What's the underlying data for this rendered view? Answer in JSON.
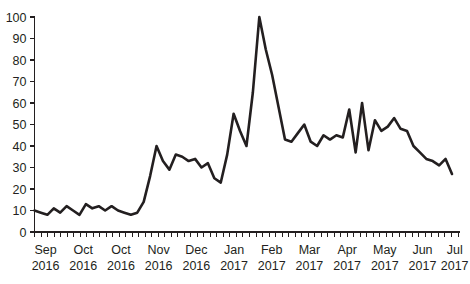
{
  "chart_data": {
    "type": "line",
    "title": "",
    "subtitle": "",
    "xlabel": "",
    "ylabel": "",
    "grid": false,
    "legend": false,
    "legend_position": "none",
    "line_color": "#231f20",
    "background_color": "#ffffff",
    "ylim": [
      0,
      100
    ],
    "yticks": [
      0,
      10,
      20,
      30,
      40,
      50,
      60,
      70,
      80,
      90,
      100
    ],
    "ytick_labels": [
      "0",
      "10",
      "20",
      "30",
      "40",
      "50",
      "60",
      "70",
      "80",
      "90",
      "100"
    ],
    "xtick_labels": [
      {
        "month": "Sep",
        "year": "2016"
      },
      {
        "month": "Oct",
        "year": "2016"
      },
      {
        "month": "Oct",
        "year": "2016"
      },
      {
        "month": "Nov",
        "year": "2016"
      },
      {
        "month": "Dec",
        "year": "2016"
      },
      {
        "month": "Jan",
        "year": "2017"
      },
      {
        "month": "Feb",
        "year": "2017"
      },
      {
        "month": "Mar",
        "year": "2017"
      },
      {
        "month": "Apr",
        "year": "2017"
      },
      {
        "month": "May",
        "year": "2017"
      },
      {
        "month": "Jun",
        "year": "2017"
      },
      {
        "month": "Jul",
        "year": "2017"
      }
    ],
    "xtick_positions_frac": [
      0.012,
      0.101,
      0.19,
      0.279,
      0.368,
      0.457,
      0.546,
      0.635,
      0.724,
      0.813,
      0.902,
      0.978
    ],
    "minor_tick_count": 66,
    "x": [
      0,
      1,
      2,
      3,
      4,
      5,
      6,
      7,
      8,
      9,
      10,
      11,
      12,
      13,
      14,
      15,
      16,
      17,
      18,
      19,
      20,
      21,
      22,
      23,
      24,
      25,
      26,
      27,
      28,
      29,
      30,
      31,
      32,
      33,
      34,
      35,
      36,
      37,
      38,
      39,
      40,
      41,
      42,
      43,
      44,
      45,
      46,
      47,
      48,
      49,
      50,
      51,
      52,
      53,
      54,
      55,
      56,
      57,
      58,
      59,
      60,
      61,
      62,
      63,
      64,
      65
    ],
    "values": [
      10,
      9,
      8,
      11,
      9,
      12,
      10,
      8,
      13,
      11,
      12,
      10,
      12,
      10,
      9,
      8,
      9,
      14,
      26,
      40,
      33,
      29,
      36,
      35,
      33,
      34,
      30,
      32,
      25,
      23,
      36,
      55,
      47,
      40,
      65,
      100,
      85,
      73,
      58,
      43,
      42,
      46,
      50,
      42,
      40,
      45,
      43,
      45,
      44,
      57,
      37,
      60,
      38,
      52,
      47,
      49,
      53,
      48,
      47,
      40,
      37,
      34,
      33,
      31,
      34,
      27
    ]
  }
}
